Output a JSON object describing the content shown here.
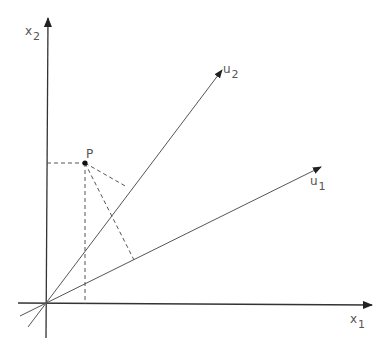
{
  "diagram": {
    "type": "coordinate-projection",
    "axes": {
      "x1": {
        "label": "x",
        "subscript": "1"
      },
      "x2": {
        "label": "x",
        "subscript": "2"
      }
    },
    "vectors": {
      "u1": {
        "label": "u",
        "subscript": "1"
      },
      "u2": {
        "label": "u",
        "subscript": "2"
      }
    },
    "point": {
      "label": "P"
    },
    "colors": {
      "axis": "#333333",
      "line": "#555555",
      "dashed": "#555555",
      "text": "#555555"
    }
  }
}
